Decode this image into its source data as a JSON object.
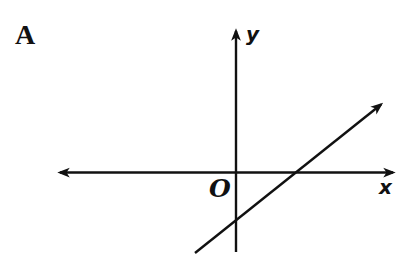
{
  "figure": {
    "option_label": "A",
    "labels": {
      "y_axis": "y",
      "x_axis": "x",
      "origin": "O"
    },
    "graph": {
      "type": "line",
      "slope_sign": "positive",
      "x_intercept_sign": "positive",
      "y_intercept_sign": "negative",
      "arrowheads": [
        "x-axis-left",
        "x-axis-right",
        "y-axis-top",
        "line-upper-right"
      ]
    },
    "colors": {
      "ink": "#111111",
      "background": "#ffffff"
    }
  }
}
